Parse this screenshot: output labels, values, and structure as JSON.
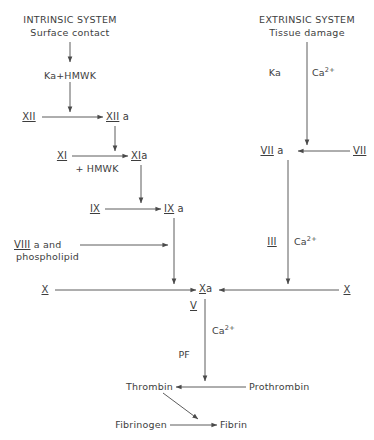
{
  "diagram": {
    "background_color": "#ffffff",
    "line_color": "#4a4a4a",
    "text_color": "#3d3d3d"
  },
  "intrinsic": {
    "heading_line1": "INTRINSIC SYSTEM",
    "heading_line2": "Surface contact",
    "activator": "Ka+HMWK",
    "factor_xii": "XII",
    "factor_xii_a_numeral": "XII",
    "factor_xii_a_suffix": " a",
    "factor_xi": "XI",
    "factor_xi_a_numeral": "XI",
    "factor_xi_a_suffix": "a",
    "cofactor_hmwk": "+ HMWK",
    "factor_ix": "IX",
    "factor_ix_a_numeral": "IX",
    "factor_ix_a_suffix": " a",
    "factor_viii_numeral": "VIII",
    "factor_viii_suffix": " a and",
    "phospholipid": "phospholipid",
    "factor_x_left": "X"
  },
  "extrinsic": {
    "heading_line1": "EXTRINSIC SYSTEM",
    "heading_line2": "Tissue damage",
    "kallikrein": "Ka",
    "calcium": "Ca",
    "calcium_charge": "2+",
    "factor_vii_a_numeral": "VII",
    "factor_vii_a_suffix": " a",
    "factor_vii": "VII",
    "factor_iii": "III",
    "calcium_right": "Ca",
    "calcium_right_charge": "2+",
    "factor_x_right": "X"
  },
  "common": {
    "factor_x_a_numeral": "X",
    "factor_x_a_suffix": "a",
    "factor_v": "V",
    "calcium": "Ca",
    "calcium_charge": "2+",
    "platelet_factor": "PF",
    "prothrombin": "Prothrombin",
    "thrombin": "Thrombin",
    "fibrinogen": "Fibrinogen",
    "fibrin": "Fibrin"
  }
}
